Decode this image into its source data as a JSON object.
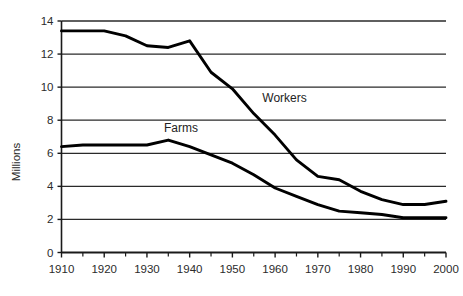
{
  "chart_data": {
    "type": "line",
    "title": "",
    "subtitle": "",
    "xlabel": "",
    "ylabel": "Millions",
    "xlim": [
      1910,
      2000
    ],
    "ylim": [
      0,
      14
    ],
    "grid": true,
    "grid_axis": "y",
    "legend_position": "inline-annotation",
    "y_ticks": [
      0,
      2,
      4,
      6,
      8,
      10,
      12,
      14
    ],
    "y_tick_labels": [
      "0",
      "2",
      "4",
      "6",
      "8",
      "10",
      "12",
      "14"
    ],
    "x_ticks": [
      1910,
      1920,
      1930,
      1940,
      1950,
      1960,
      1970,
      1980,
      1990,
      2000
    ],
    "x_tick_labels": [
      "1910",
      "1920",
      "1930",
      "1940",
      "1950",
      "1960",
      "1970",
      "1980",
      "1990",
      "2000"
    ],
    "x_minor_ticks": [
      1915,
      1925,
      1935,
      1945,
      1955,
      1965,
      1975,
      1985,
      1995
    ],
    "series": [
      {
        "name": "Workers",
        "color": "#000000",
        "label_x": 1957,
        "label_y": 9.1,
        "x": [
          1910,
          1915,
          1920,
          1925,
          1930,
          1935,
          1940,
          1945,
          1950,
          1955,
          1960,
          1965,
          1970,
          1975,
          1980,
          1985,
          1990,
          1995,
          2000
        ],
        "values": [
          13.4,
          13.4,
          13.4,
          13.1,
          12.5,
          12.4,
          12.8,
          10.9,
          9.9,
          8.4,
          7.1,
          5.6,
          4.6,
          4.4,
          3.7,
          3.2,
          2.9,
          2.9,
          3.1
        ]
      },
      {
        "name": "Farms",
        "color": "#000000",
        "label_x": 1934,
        "label_y": 7.3,
        "x": [
          1910,
          1915,
          1920,
          1925,
          1930,
          1935,
          1940,
          1945,
          1950,
          1955,
          1960,
          1965,
          1970,
          1975,
          1980,
          1985,
          1990,
          1995,
          2000
        ],
        "values": [
          6.4,
          6.5,
          6.5,
          6.5,
          6.5,
          6.8,
          6.4,
          5.9,
          5.4,
          4.7,
          3.9,
          3.4,
          2.9,
          2.5,
          2.4,
          2.3,
          2.1,
          2.1,
          2.1
        ]
      }
    ]
  },
  "axis": {
    "y_title": "Millions"
  }
}
